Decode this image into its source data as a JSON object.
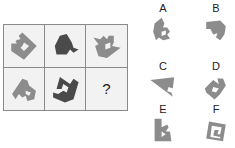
{
  "puzzle": {
    "grid": [
      {
        "id": "r1c1",
        "shape": "hooked-pentagon",
        "tone": "light"
      },
      {
        "id": "r1c2",
        "shape": "bird-blob",
        "tone": "dark"
      },
      {
        "id": "r1c3",
        "shape": "notched-wedge",
        "tone": "light"
      },
      {
        "id": "r2c1",
        "shape": "stepped-arrow",
        "tone": "light"
      },
      {
        "id": "r2c2",
        "shape": "horned-wedge",
        "tone": "dark"
      },
      {
        "id": "r2c3",
        "shape": "unknown",
        "tone": "none"
      }
    ],
    "missing_cell_label": "?",
    "options": [
      {
        "label": "A",
        "shape": "notched-tile"
      },
      {
        "label": "B",
        "shape": "cut-blob"
      },
      {
        "label": "C",
        "shape": "triangle-notch"
      },
      {
        "label": "D",
        "shape": "rotated-notched-square"
      },
      {
        "label": "E",
        "shape": "upright-notched-tile"
      },
      {
        "label": "F",
        "shape": "spiral-square"
      }
    ],
    "colors": {
      "light_shape": "#8c8c8c",
      "dark_shape": "#4a4a4a",
      "grid_line": "#8a8a8a",
      "cell_bg": "#f2f2f2"
    }
  }
}
